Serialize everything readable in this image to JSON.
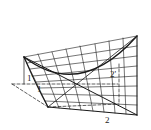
{
  "diagram": {
    "title": "",
    "labels": {
      "l1p": "1'",
      "l1": "1",
      "l2p": "2'",
      "l2": "2"
    },
    "colors": {
      "stroke": "#1a1a1a",
      "background": "#ffffff"
    }
  }
}
